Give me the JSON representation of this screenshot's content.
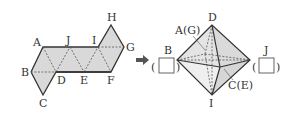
{
  "net": {
    "labels": {
      "A": "A",
      "B": "B",
      "C": "C",
      "D": "D",
      "E": "E",
      "F": "F",
      "G": "G",
      "H": "H",
      "I": "I",
      "J": "J"
    }
  },
  "arrow": {
    "icon": "right-arrow-icon"
  },
  "octahedron": {
    "top_label": "D",
    "upper_left_label": "A(G)",
    "left_label": "B",
    "right_label": "J",
    "lower_right_label": "C(E)",
    "bottom_label": "I",
    "left_answer_box": "",
    "right_answer_box": ""
  },
  "colors": {
    "fill": "#d9d9d9",
    "stroke": "#333333"
  }
}
